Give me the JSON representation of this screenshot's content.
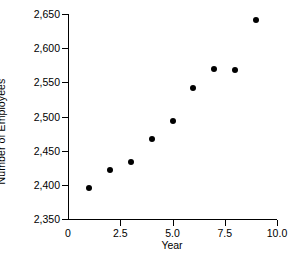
{
  "chart_data": {
    "type": "scatter",
    "title": "",
    "xlabel": "Year",
    "ylabel": "Number of Employees",
    "x": [
      1,
      2,
      3,
      4,
      5,
      6,
      7,
      8,
      9
    ],
    "values": [
      2396,
      2422,
      2434,
      2467,
      2493,
      2541,
      2570,
      2568,
      2641
    ],
    "series": [
      {
        "name": "Number of Employees",
        "points": [
          {
            "x": 1,
            "y": 2396
          },
          {
            "x": 2,
            "y": 2422
          },
          {
            "x": 3,
            "y": 2434
          },
          {
            "x": 4,
            "y": 2467
          },
          {
            "x": 5,
            "y": 2493
          },
          {
            "x": 6,
            "y": 2541
          },
          {
            "x": 7,
            "y": 2570
          },
          {
            "x": 8,
            "y": 2568
          },
          {
            "x": 9,
            "y": 2641
          }
        ]
      }
    ],
    "xlim": [
      0,
      10
    ],
    "ylim": [
      2350,
      2650
    ],
    "xticks": [
      0,
      2.5,
      5.0,
      7.5,
      10.0
    ],
    "xtick_labels": [
      "0",
      "2.5",
      "5.0",
      "7.5",
      "10.0"
    ],
    "yticks": [
      2350,
      2400,
      2450,
      2500,
      2550,
      2600,
      2650
    ],
    "ytick_labels": [
      "2,350",
      "2,400",
      "2,450",
      "2,500",
      "2,550",
      "2,600",
      "2,650"
    ],
    "grid": false,
    "legend": false,
    "marker_color": "#000000",
    "axis_color": "#000000",
    "background_color": "#ffffff"
  },
  "caption_fragment": ""
}
